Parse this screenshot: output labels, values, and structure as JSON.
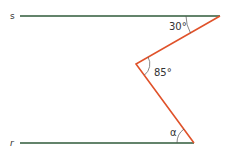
{
  "diagram": {
    "lines": {
      "s": {
        "label": "s",
        "color": "#2f5a3a"
      },
      "r": {
        "label": "r",
        "color": "#2f5a3a"
      }
    },
    "transversal_color": "#e0522a",
    "angles": {
      "top": "30°",
      "middle": "85°",
      "bottom": "α"
    }
  }
}
